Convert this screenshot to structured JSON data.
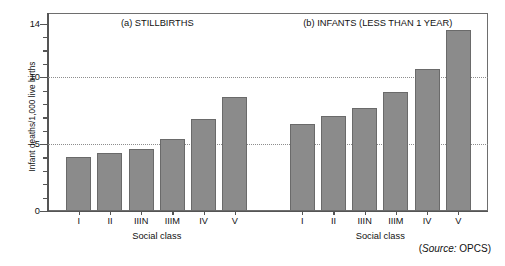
{
  "chart_data": {
    "type": "bar",
    "title": "",
    "ylabel": "Infant deaths/1,000 live births",
    "xlabel": "Social class",
    "ylim": [
      0,
      14.8
    ],
    "yticks_major": [
      0,
      5,
      10,
      14
    ],
    "yticks_minor": [
      1,
      2,
      3,
      4,
      6,
      7,
      8,
      9,
      11,
      12,
      13
    ],
    "gridlines_at": [
      5,
      10
    ],
    "grid": "dotted-horizontal",
    "legend": "none",
    "categories": [
      "I",
      "II",
      "IIIN",
      "IIIM",
      "IV",
      "V"
    ],
    "panels": [
      {
        "key": "a",
        "title": "(a) STILLBIRTHS",
        "xlabel": "Social class",
        "categories": [
          "I",
          "II",
          "IIIN",
          "IIIM",
          "IV",
          "V"
        ],
        "values": [
          4.0,
          4.3,
          4.6,
          5.4,
          6.9,
          8.5
        ]
      },
      {
        "key": "b",
        "title": "(b) INFANTS (LESS THAN 1 YEAR)",
        "xlabel": "Social class",
        "categories": [
          "I",
          "II",
          "IIIN",
          "IIIM",
          "IV",
          "V"
        ],
        "values": [
          6.5,
          7.1,
          7.7,
          8.9,
          10.6,
          13.5
        ]
      }
    ],
    "source": {
      "prefix": "(",
      "italic": "Source:",
      "text": " OPCS)"
    },
    "colors": {
      "bar_fill": "#8b8b8b",
      "bar_stroke": "#6a6a6a",
      "axis": "#555555",
      "grid": "#8d8d8d",
      "text": "#111111",
      "background": "#ffffff"
    }
  }
}
